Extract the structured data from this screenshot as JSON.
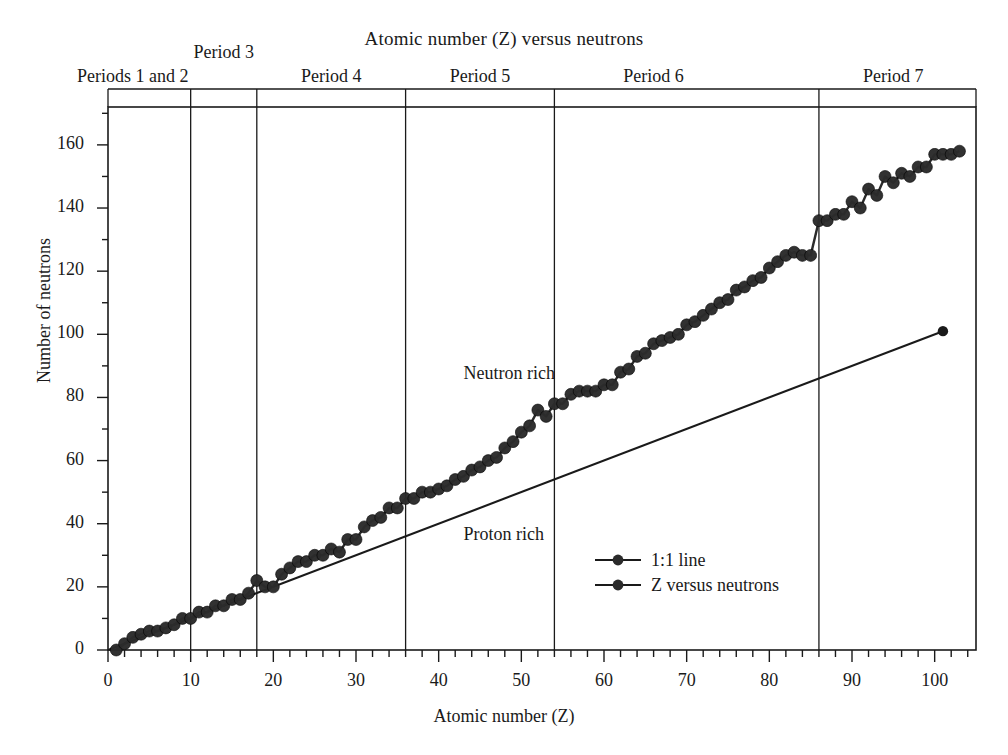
{
  "chart_data": {
    "type": "line",
    "title": "Atomic number (Z) versus neutrons",
    "xlabel": "Atomic number (Z)",
    "ylabel": "Number of neutrons",
    "xlim": [
      0,
      105
    ],
    "ylim": [
      0,
      172
    ],
    "grid": false,
    "x_major_ticks": [
      0,
      10,
      20,
      30,
      40,
      50,
      60,
      70,
      80,
      90,
      100
    ],
    "x_tick_labels": [
      "0",
      "10",
      "20",
      "30",
      "40",
      "50",
      "60",
      "70",
      "80",
      "90",
      "100"
    ],
    "x_minor_interval": 2,
    "y_major_ticks": [
      0,
      20,
      40,
      60,
      80,
      100,
      120,
      140,
      160
    ],
    "y_tick_labels": [
      "0",
      "20",
      "40",
      "60",
      "80",
      "100",
      "120",
      "140",
      "160"
    ],
    "y_minor_interval": 10,
    "legend_position": "inside-lower-center-right",
    "series": [
      {
        "name": "1:1 line",
        "marker": "circle-endpoint-only",
        "x": [
          0,
          101
        ],
        "values": [
          0,
          101
        ]
      },
      {
        "name": "Z versus neutrons",
        "marker": "filled-circle",
        "x": [
          1,
          2,
          3,
          4,
          5,
          6,
          7,
          8,
          9,
          10,
          11,
          12,
          13,
          14,
          15,
          16,
          17,
          18,
          19,
          20,
          21,
          22,
          23,
          24,
          25,
          26,
          27,
          28,
          29,
          30,
          31,
          32,
          33,
          34,
          35,
          36,
          37,
          38,
          39,
          40,
          41,
          42,
          43,
          44,
          45,
          46,
          47,
          48,
          49,
          50,
          51,
          52,
          53,
          54,
          55,
          56,
          57,
          58,
          59,
          60,
          61,
          62,
          63,
          64,
          65,
          66,
          67,
          68,
          69,
          70,
          71,
          72,
          73,
          74,
          75,
          76,
          77,
          78,
          79,
          80,
          81,
          82,
          83,
          84,
          85,
          86,
          87,
          88,
          89,
          90,
          91,
          92,
          93,
          94,
          95,
          96,
          97,
          98,
          99,
          100,
          101,
          102,
          103
        ],
        "values": [
          0,
          2,
          4,
          5,
          6,
          6,
          7,
          8,
          10,
          10,
          12,
          12,
          14,
          14,
          16,
          16,
          18,
          22,
          20,
          20,
          24,
          26,
          28,
          28,
          30,
          30,
          32,
          31,
          35,
          35,
          39,
          41,
          42,
          45,
          45,
          48,
          48,
          50,
          50,
          51,
          52,
          54,
          55,
          57,
          58,
          60,
          61,
          64,
          66,
          69,
          71,
          76,
          74,
          78,
          78,
          81,
          82,
          82,
          82,
          84,
          84,
          88,
          89,
          93,
          94,
          97,
          98,
          99,
          100,
          103,
          104,
          106,
          108,
          110,
          111,
          114,
          115,
          117,
          118,
          121,
          123,
          125,
          126,
          125,
          125,
          136,
          136,
          138,
          138,
          142,
          140,
          146,
          144,
          150,
          148,
          151,
          150,
          153,
          153,
          157,
          157,
          157,
          158
        ]
      }
    ],
    "annotations": [
      {
        "text": "Neutron rich",
        "x": 43,
        "y": 87
      },
      {
        "text": "Proton rich",
        "x": 43,
        "y": 36
      }
    ],
    "period_dividers": [
      10,
      18,
      36,
      54,
      86
    ],
    "period_labels": [
      {
        "text": "Periods 1 and 2",
        "center_z": 3,
        "row": "lower"
      },
      {
        "text": "Period 3",
        "center_z": 14,
        "row": "upper"
      },
      {
        "text": "Period 4",
        "center_z": 27,
        "row": "lower"
      },
      {
        "text": "Period 5",
        "center_z": 45,
        "row": "lower"
      },
      {
        "text": "Period 6",
        "center_z": 66,
        "row": "lower"
      },
      {
        "text": "Period 7",
        "center_z": 95,
        "row": "lower"
      }
    ]
  },
  "colors": {
    "ink": "#1a1a1a",
    "marker": "#2b2b2b",
    "background": "#ffffff"
  }
}
